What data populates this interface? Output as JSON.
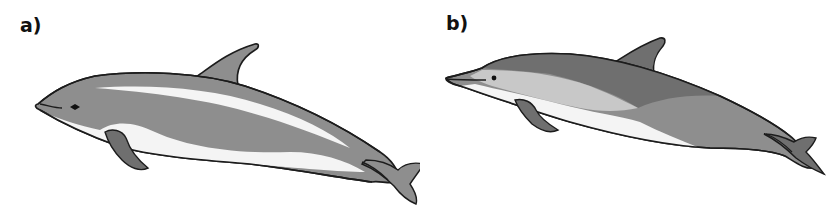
{
  "panels": [
    {
      "label": "a)",
      "subject": "dolphin-illustration-a"
    },
    {
      "label": "b)",
      "subject": "dolphin-illustration-b"
    }
  ],
  "colors": {
    "background": "#ffffff",
    "outline": "#1c1c1c",
    "body_grey": "#8e8e8e",
    "dark_grey": "#6f6f6f",
    "light_grey": "#c8c8c8",
    "belly_white": "#f4f4f4",
    "label": "#111111"
  }
}
